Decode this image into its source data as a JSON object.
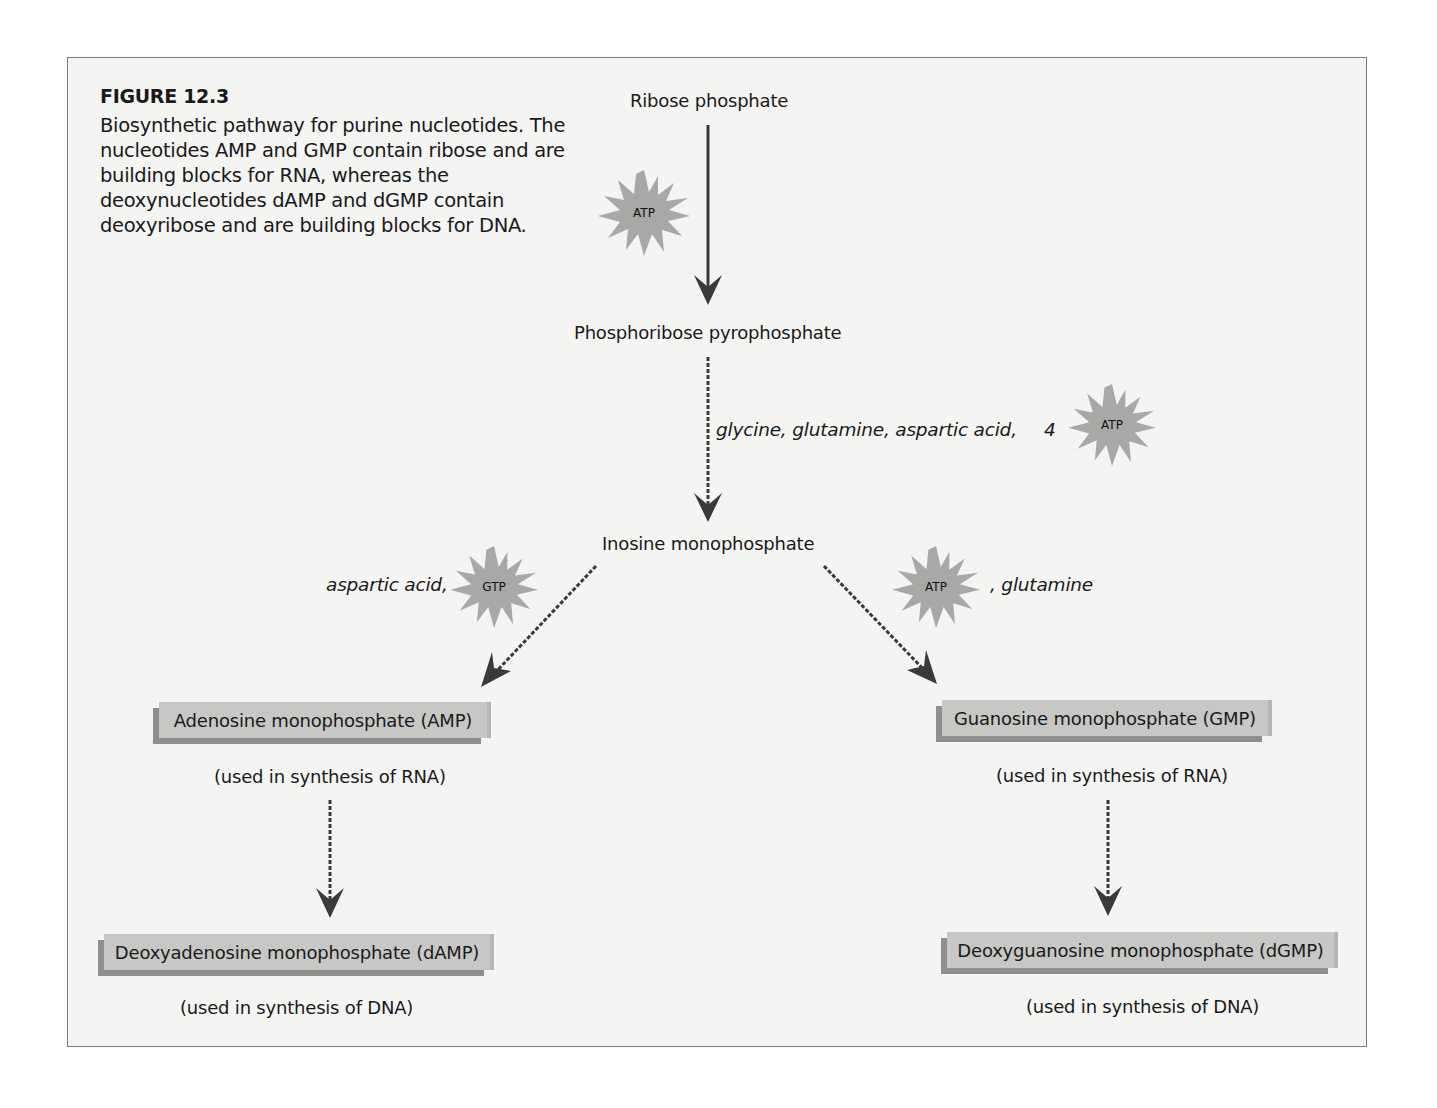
{
  "figure": {
    "title": "FIGURE 12.3",
    "caption": "Biosynthetic pathway for purine nucleotides. The nucleotides AMP and GMP contain ribose and are building blocks for RNA, whereas the deoxynucleotides dAMP and dGMP contain deoxyribose and are building blocks for DNA."
  },
  "nodes": {
    "ribose_phosphate": "Ribose phosphate",
    "prpp": "Phosphoribose pyrophosphate",
    "imp": "Inosine monophosphate",
    "amp": "Adenosine monophosphate (AMP)",
    "gmp": "Guanosine monophosphate (GMP)",
    "damp": "Deoxyadenosine monophosphate (dAMP)",
    "dgmp": "Deoxyguanosine monophosphate (dGMP)"
  },
  "notes": {
    "amp_use": "(used in synthesis of RNA)",
    "gmp_use": "(used in synthesis of RNA)",
    "damp_use": "(used in synthesis of DNA)",
    "dgmp_use": "(used in synthesis of DNA)"
  },
  "reactants": {
    "prpp_to_imp": "glycine, glutamine, aspartic acid,",
    "prpp_to_imp_atp_count": "4",
    "imp_to_amp": "aspartic acid,",
    "imp_to_gmp": ", glutamine"
  },
  "energy": {
    "ribose_step": "ATP",
    "imp_step": "ATP",
    "amp_step": "GTP",
    "gmp_step": "ATP"
  },
  "colors": {
    "background": "#f4f4f3",
    "burst": "#a8a8a7",
    "box": "#c7c7c6",
    "box_shadow": "#8e8e8d",
    "arrow": "#3a3a3a"
  }
}
